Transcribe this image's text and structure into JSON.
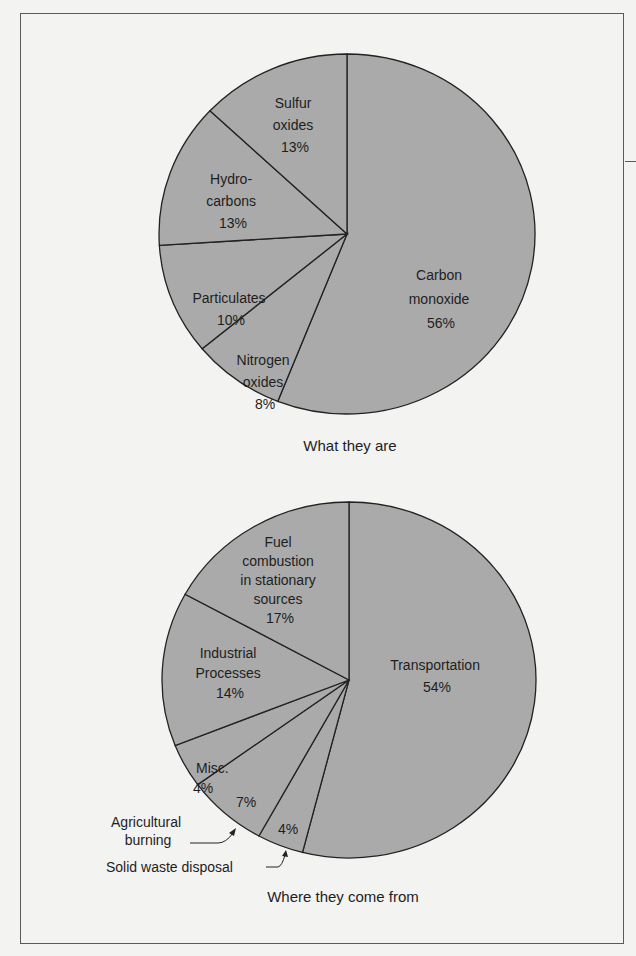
{
  "chart_data": [
    {
      "type": "pie",
      "title": "What they are",
      "categories": [
        "Carbon monoxide",
        "Nitrogen oxides",
        "Particulates",
        "Hydrocarbons",
        "Sulfur oxides"
      ],
      "values": [
        56,
        8,
        10,
        13,
        13
      ],
      "unit": "%",
      "slices": [
        {
          "name": "Carbon monoxide",
          "label_lines": [
            "Carbon",
            "monoxide",
            "56%"
          ],
          "value": 56
        },
        {
          "name": "Nitrogen oxides",
          "label_lines": [
            "Nitrogen",
            "oxides",
            "8%"
          ],
          "value": 8
        },
        {
          "name": "Particulates",
          "label_lines": [
            "Particulates",
            "10%"
          ],
          "value": 10
        },
        {
          "name": "Hydrocarbons",
          "label_lines": [
            "Hydro-",
            "carbons",
            "13%"
          ],
          "value": 13
        },
        {
          "name": "Sulfur oxides",
          "label_lines": [
            "Sulfur",
            "oxides",
            "13%"
          ],
          "value": 13
        }
      ],
      "start_angle": "12 o'clock, clockwise",
      "fill_color": "#aaaaaa",
      "legend": "none (labels inside slices)"
    },
    {
      "type": "pie",
      "title": "Where they come from",
      "categories": [
        "Transportation",
        "Solid waste disposal",
        "Agricultural burning",
        "Misc.",
        "Industrial Processes",
        "Fuel combustion in stationary sources"
      ],
      "values": [
        54,
        4,
        7,
        4,
        14,
        17
      ],
      "unit": "%",
      "slices": [
        {
          "name": "Transportation",
          "label_lines": [
            "Transportation",
            "54%"
          ],
          "value": 54
        },
        {
          "name": "Solid waste disposal",
          "label_lines": [
            "4%"
          ],
          "callout": "Solid waste disposal",
          "value": 4
        },
        {
          "name": "Agricultural burning",
          "label_lines": [
            "7%"
          ],
          "callout_lines": [
            "Agricultural",
            "burning"
          ],
          "value": 7
        },
        {
          "name": "Misc.",
          "label_lines": [
            "Misc.",
            "4%"
          ],
          "value": 4
        },
        {
          "name": "Industrial Processes",
          "label_lines": [
            "Industrial",
            "Processes",
            "14%"
          ],
          "value": 14
        },
        {
          "name": "Fuel combustion in stationary sources",
          "label_lines": [
            "Fuel",
            "combustion",
            "in stationary",
            "sources",
            "17%"
          ],
          "value": 17
        }
      ],
      "start_angle": "12 o'clock, clockwise",
      "fill_color": "#aaaaaa",
      "legend": "none (labels inside slices, callouts for small slices)"
    }
  ]
}
